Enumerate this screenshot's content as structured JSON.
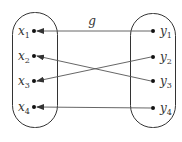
{
  "diagram": {
    "function_label": "g",
    "domain_set": {
      "name": "Y",
      "elements": [
        {
          "base": "y",
          "sub": "1"
        },
        {
          "base": "y",
          "sub": "2"
        },
        {
          "base": "y",
          "sub": "3"
        },
        {
          "base": "y",
          "sub": "4"
        }
      ]
    },
    "codomain_set": {
      "name": "X",
      "elements": [
        {
          "base": "x",
          "sub": "1"
        },
        {
          "base": "x",
          "sub": "2"
        },
        {
          "base": "x",
          "sub": "3"
        },
        {
          "base": "x",
          "sub": "4"
        }
      ]
    },
    "mappings": [
      {
        "from": "y1",
        "to": "x1"
      },
      {
        "from": "y2",
        "to": "x3"
      },
      {
        "from": "y3",
        "to": "x2"
      },
      {
        "from": "y4",
        "to": "x4"
      }
    ]
  }
}
